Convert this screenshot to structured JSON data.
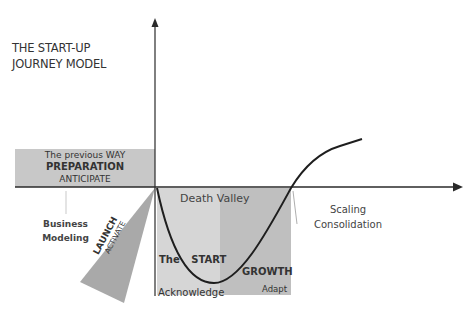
{
  "title": {
    "line1": "THE START-UP",
    "line2": "JOURNEY MODEL"
  },
  "preparation": {
    "line1": "The previous WAY",
    "line2": "PREPARATION",
    "line3": "ANTICIPATE",
    "color": "#c8c8c8"
  },
  "business_modeling": {
    "line1": "Business",
    "line2": "Modeling"
  },
  "launch": {
    "label": "LAUNCH",
    "sublabel": "ACTIVATE",
    "color": "#a9a9a9"
  },
  "death_valley": {
    "label": "Death Valley",
    "start_color": "#d6d6d6",
    "growth_color": "#bfbfbf"
  },
  "start_phase": {
    "label_the": "The",
    "label": "START",
    "sublabel": "Acknowledge"
  },
  "growth_phase": {
    "label": "GROWTH",
    "sublabel": "Adapt"
  },
  "scaling": {
    "line1": "Scaling",
    "line2": "Consolidation"
  },
  "colors": {
    "axis": "#2a2a2a",
    "curve": "#1e1e1e"
  }
}
